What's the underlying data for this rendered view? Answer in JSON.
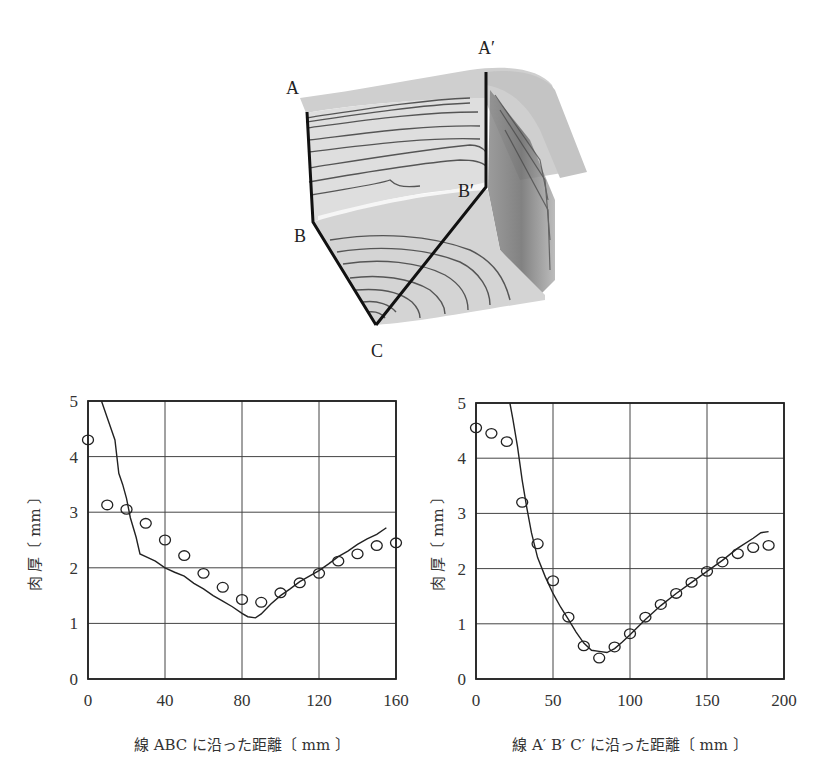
{
  "figure_3d": {
    "labels": {
      "A": "A",
      "B": "B",
      "C": "C",
      "A_prime": "A′",
      "B_prime": "B′"
    }
  },
  "chart_data": [
    {
      "type": "line",
      "title": "",
      "xlabel": "線 ABC に沿った距離〔 mm 〕",
      "ylabel": "肉 厚〔 mm 〕",
      "xlim": [
        0,
        160
      ],
      "ylim": [
        0,
        5
      ],
      "xticks": [
        0,
        40,
        80,
        120,
        160
      ],
      "yticks": [
        0,
        1,
        2,
        3,
        4,
        5
      ],
      "grid": true,
      "legend": null,
      "series": [
        {
          "name": "simulation",
          "style": "line",
          "x": [
            7,
            10,
            14,
            16,
            18,
            20,
            22,
            25,
            27,
            30,
            35,
            40,
            45,
            50,
            55,
            60,
            65,
            70,
            75,
            80,
            83,
            87,
            90,
            95,
            100,
            105,
            110,
            115,
            120,
            125,
            130,
            135,
            140,
            145,
            150,
            155
          ],
          "y": [
            5.0,
            4.7,
            4.3,
            3.7,
            3.5,
            3.25,
            2.9,
            2.55,
            2.25,
            2.2,
            2.12,
            2.0,
            1.92,
            1.85,
            1.72,
            1.62,
            1.5,
            1.4,
            1.3,
            1.18,
            1.12,
            1.1,
            1.17,
            1.35,
            1.5,
            1.62,
            1.75,
            1.85,
            1.95,
            2.07,
            2.2,
            2.3,
            2.42,
            2.52,
            2.6,
            2.72
          ]
        },
        {
          "name": "measured",
          "style": "marker-circle",
          "x": [
            0,
            10,
            20,
            30,
            40,
            50,
            60,
            70,
            80,
            90,
            100,
            110,
            120,
            130,
            140,
            150,
            160
          ],
          "y": [
            4.3,
            3.13,
            3.05,
            2.8,
            2.5,
            2.22,
            1.9,
            1.65,
            1.43,
            1.38,
            1.55,
            1.73,
            1.9,
            2.12,
            2.25,
            2.4,
            2.45
          ]
        }
      ]
    },
    {
      "type": "line",
      "title": "",
      "xlabel": "線 A′ B′ C′ に沿った距離〔 mm 〕",
      "ylabel": "肉 厚〔 mm 〕",
      "xlim": [
        0,
        200
      ],
      "ylim": [
        0,
        5
      ],
      "xticks": [
        0,
        50,
        100,
        150,
        200
      ],
      "yticks": [
        0,
        1,
        2,
        3,
        4,
        5
      ],
      "grid": true,
      "legend": null,
      "series": [
        {
          "name": "simulation",
          "style": "line",
          "x": [
            22,
            24,
            27,
            30,
            33,
            36,
            40,
            45,
            50,
            55,
            60,
            65,
            70,
            75,
            80,
            85,
            90,
            95,
            100,
            110,
            120,
            130,
            140,
            150,
            160,
            170,
            180,
            185,
            190
          ],
          "y": [
            5.0,
            4.7,
            4.2,
            3.6,
            3.1,
            2.65,
            2.2,
            1.85,
            1.55,
            1.3,
            1.08,
            0.85,
            0.65,
            0.52,
            0.5,
            0.48,
            0.55,
            0.67,
            0.8,
            1.08,
            1.33,
            1.55,
            1.75,
            1.95,
            2.15,
            2.37,
            2.55,
            2.65,
            2.67
          ]
        },
        {
          "name": "measured",
          "style": "marker-circle",
          "x": [
            0,
            10,
            20,
            30,
            40,
            50,
            60,
            70,
            80,
            90,
            100,
            110,
            120,
            130,
            140,
            150,
            160,
            170,
            180,
            190
          ],
          "y": [
            4.55,
            4.45,
            4.3,
            3.2,
            2.45,
            1.78,
            1.12,
            0.6,
            0.38,
            0.58,
            0.82,
            1.12,
            1.35,
            1.55,
            1.75,
            1.95,
            2.12,
            2.27,
            2.38,
            2.42
          ]
        }
      ]
    }
  ]
}
